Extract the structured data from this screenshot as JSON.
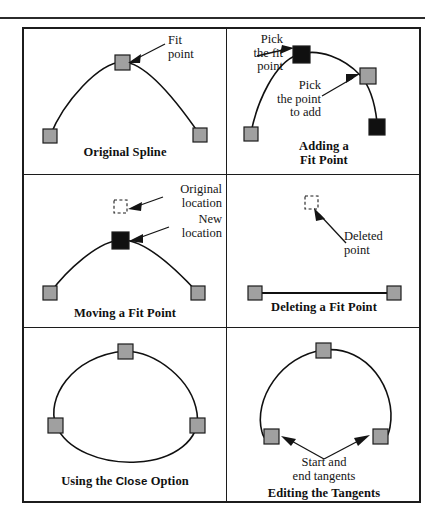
{
  "figure": {
    "type": "instructional-diagram",
    "panel_count": 6,
    "colors": {
      "marker_gray_fill": "#a0a0a0",
      "marker_black_fill": "#101010",
      "marker_stroke": "#1c1c1c",
      "curve_stroke": "#101010",
      "border": "#1c1c1c",
      "background": "#ffffff"
    }
  },
  "panels": [
    {
      "id": "original-spline",
      "caption": "Original Spline",
      "callouts": [
        {
          "id": "fit-point",
          "text": "Fit\npoint",
          "align": "left"
        }
      ],
      "markers": [
        {
          "style": "gray",
          "role": "start-fit-point"
        },
        {
          "style": "gray",
          "role": "apex-fit-point"
        },
        {
          "style": "gray",
          "role": "end-fit-point"
        }
      ]
    },
    {
      "id": "adding-a-fit-point",
      "caption_line1": "Adding a",
      "caption_line2": "Fit Point",
      "callouts": [
        {
          "id": "pick-the-fit-point",
          "text": "Pick\nthe fit\npoint",
          "align": "right"
        },
        {
          "id": "pick-the-point-to-add",
          "text": "Pick\nthe point\nto add",
          "align": "right"
        }
      ],
      "markers": [
        {
          "style": "gray",
          "role": "start-fit-point"
        },
        {
          "style": "black",
          "role": "selected-fit-point"
        },
        {
          "style": "gray",
          "role": "new-point-location"
        },
        {
          "style": "black",
          "role": "end-point"
        }
      ]
    },
    {
      "id": "moving-a-fit-point",
      "caption": "Moving a Fit Point",
      "callouts": [
        {
          "id": "original-location",
          "text": "Original\nlocation",
          "align": "right"
        },
        {
          "id": "new-location",
          "text": "New\nlocation",
          "align": "left"
        }
      ],
      "markers": [
        {
          "style": "dashed",
          "role": "original-location"
        },
        {
          "style": "black",
          "role": "new-location"
        },
        {
          "style": "gray",
          "role": "start-fit-point"
        },
        {
          "style": "gray",
          "role": "end-fit-point"
        }
      ]
    },
    {
      "id": "deleting-a-fit-point",
      "caption": "Deleting a Fit Point",
      "callouts": [
        {
          "id": "deleted-point",
          "text": "Deleted\npoint",
          "align": "left"
        }
      ],
      "markers": [
        {
          "style": "dashed",
          "role": "deleted-point"
        },
        {
          "style": "gray",
          "role": "start-fit-point"
        },
        {
          "style": "gray",
          "role": "end-fit-point"
        }
      ]
    },
    {
      "id": "using-the-close-option",
      "caption_pre": "Using the ",
      "caption_command": "Close",
      "caption_post": " Option",
      "callouts": [],
      "markers": [
        {
          "style": "gray",
          "role": "top-fit-point"
        },
        {
          "style": "gray",
          "role": "left-fit-point"
        },
        {
          "style": "gray",
          "role": "right-fit-point"
        }
      ]
    },
    {
      "id": "editing-the-tangents",
      "caption": "Editing the Tangents",
      "callouts": [
        {
          "id": "start-and-end-tangents",
          "text": "Start and\nend tangents",
          "align": "center"
        }
      ],
      "markers": [
        {
          "style": "gray",
          "role": "top-fit-point"
        },
        {
          "style": "gray",
          "role": "start-tangent-point"
        },
        {
          "style": "gray",
          "role": "end-tangent-point"
        }
      ]
    }
  ]
}
